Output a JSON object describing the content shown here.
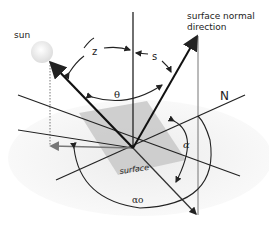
{
  "diagram": {
    "labels": {
      "sun": "sun",
      "surface_normal_line1": "surface normal",
      "surface_normal_line2": "direction",
      "zenith_angle": "z",
      "tilt_angle": "s",
      "incidence_angle": "θ",
      "north": "N",
      "surface_azimuth": "α",
      "solar_azimuth": "αo",
      "surface": "surface"
    },
    "colors": {
      "background": "#ffffff",
      "ground_plane": "#f0f0f0",
      "surface_fill": "#c8c8c8",
      "line": "#222222",
      "projection_line": "#777777",
      "sun_fill": "#f2f2f2"
    }
  }
}
